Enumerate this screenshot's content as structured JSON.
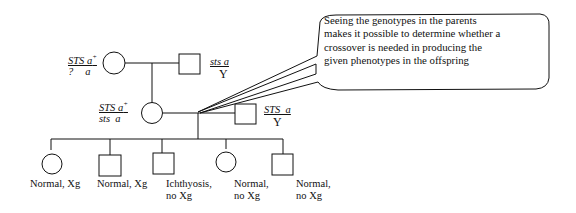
{
  "callout": {
    "lines": [
      "Seeing the genotypes in the parents",
      "makes it possible to determine whether a",
      "crossover is needed in producing the",
      "given phenotypes in the offspring"
    ]
  },
  "generation1": {
    "mother": {
      "genotype_top": "STS a",
      "genotype_top_sup": "+",
      "genotype_bottom_left": "?",
      "genotype_bottom_right": "a"
    },
    "father": {
      "genotype_top": "sts a",
      "genotype_bottom": "Y"
    }
  },
  "generation2": {
    "mother": {
      "genotype_top": "STS a",
      "genotype_top_sup": "+",
      "genotype_bottom": "sts  a"
    },
    "father": {
      "genotype_top": "STS  a",
      "genotype_bottom": "Y"
    }
  },
  "offspring": [
    {
      "sex": "female",
      "line1": "Normal, Xg",
      "line2": ""
    },
    {
      "sex": "male",
      "line1": "Normal, Xg",
      "line2": ""
    },
    {
      "sex": "male",
      "line1": "Ichthyosis,",
      "line2": "no Xg"
    },
    {
      "sex": "female",
      "line1": "Normal,",
      "line2": "no Xg"
    },
    {
      "sex": "male",
      "line1": "Normal,",
      "line2": "no Xg"
    }
  ]
}
